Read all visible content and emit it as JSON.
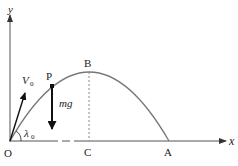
{
  "diagram": {
    "axes": {
      "x_label": "x",
      "y_label": "y",
      "origin_label": "O"
    },
    "points": {
      "P": "P",
      "B": "B",
      "C": "C",
      "A": "A"
    },
    "vectors": {
      "initial_velocity": {
        "label": "V",
        "subscript": "0"
      },
      "weight": {
        "label": "mg"
      }
    },
    "angle": {
      "label": "λ",
      "subscript": "0"
    },
    "colors": {
      "curve": "#777777",
      "axes": "#555555",
      "arrows": "#111111",
      "dashed": "#888888",
      "text": "#222222"
    }
  }
}
